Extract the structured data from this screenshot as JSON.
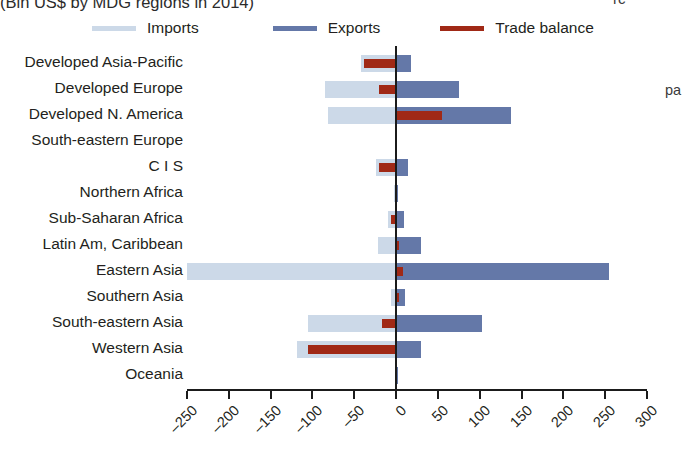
{
  "title": {
    "text": "(Bln US$ by MDG regions in 2014)"
  },
  "margin_text": {
    "top_right_fragment": "rc",
    "side_fragment": "pa"
  },
  "legend": {
    "position": "top",
    "items": [
      {
        "label": "Imports",
        "color": "#ccd9e8"
      },
      {
        "label": "Exports",
        "color": "#6478a8"
      },
      {
        "label": "Trade balance",
        "color": "#a02916"
      }
    ]
  },
  "axis": {
    "x_ticks": [
      -250,
      -200,
      -150,
      -100,
      -50,
      0,
      50,
      100,
      150,
      200,
      250,
      300
    ],
    "x_tick_labels": [
      "-250",
      "-200",
      "-150",
      "-100",
      "-50",
      "0",
      "50",
      "100",
      "150",
      "200",
      "250",
      "300"
    ],
    "xmin": -250,
    "xmax": 300,
    "zero_value": 0
  },
  "chart_data": {
    "type": "bar",
    "orientation": "horizontal",
    "title": "(Bln US$ by MDG regions in 2014)",
    "xlabel": "",
    "ylabel": "",
    "xlim": [
      -250,
      300
    ],
    "grid": false,
    "legend_position": "top",
    "categories": [
      "Developed Asia-Pacific",
      "Developed Europe",
      "Developed N. America",
      "South-eastern Europe",
      "C I S",
      "Northern Africa",
      "Sub-Saharan Africa",
      "Latin Am, Caribbean",
      "Eastern Asia",
      "Southern Asia",
      "South-eastern Asia",
      "Western Asia",
      "Oceania"
    ],
    "series": [
      {
        "name": "Imports",
        "color": "#ccd9e8",
        "values": [
          -42,
          -85,
          -82,
          -1,
          -24,
          -2,
          -10,
          -22,
          -250,
          -6,
          -105,
          -118,
          -1
        ]
      },
      {
        "name": "Exports",
        "color": "#6478a8",
        "values": [
          18,
          75,
          137,
          1,
          14,
          2,
          9,
          30,
          255,
          11,
          103,
          30,
          2
        ]
      },
      {
        "name": "Trade balance",
        "color": "#a02916",
        "values": [
          -38,
          -20,
          55,
          0,
          -20,
          0,
          -6,
          4,
          8,
          3,
          -17,
          -105,
          0
        ]
      }
    ]
  }
}
